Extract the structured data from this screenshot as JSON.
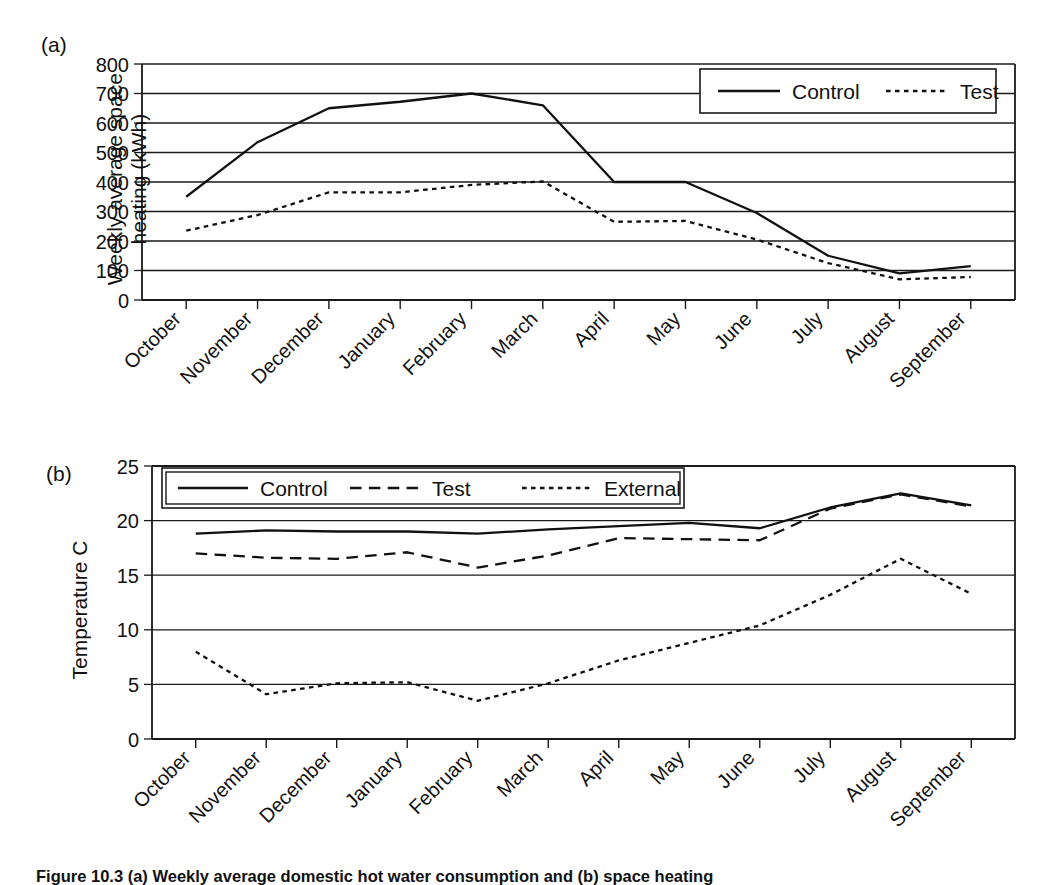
{
  "figure": {
    "panel_a_tag": "(a)",
    "panel_b_tag": "(b)",
    "caption": "Figure 10.3  (a) Weekly average domestic hot water consumption and (b) space heating"
  },
  "chart_data": [
    {
      "id": "panel-a",
      "type": "line",
      "title": "",
      "panel_label": "(a)",
      "xlabel": "",
      "ylabel": "Weekly average space\nheating (kWh)",
      "ylabel_flat": "Weekly average space heating (kWh)",
      "categories": [
        "October",
        "November",
        "December",
        "January",
        "February",
        "March",
        "April",
        "May",
        "June",
        "July",
        "August",
        "September"
      ],
      "ylim": [
        0,
        800
      ],
      "ytick_step": 100,
      "yticks": [
        "0",
        "100",
        "200",
        "300",
        "400",
        "500",
        "600",
        "700",
        "800"
      ],
      "grid": "horizontal",
      "legend_position": "top-right-inside",
      "series": [
        {
          "name": "Control",
          "style": "solid",
          "values": [
            350,
            535,
            650,
            672,
            700,
            660,
            400,
            400,
            295,
            150,
            90,
            115
          ]
        },
        {
          "name": "Test",
          "style": "dotted",
          "values": [
            235,
            288,
            365,
            365,
            390,
            402,
            265,
            268,
            205,
            125,
            70,
            78
          ]
        }
      ]
    },
    {
      "id": "panel-b",
      "type": "line",
      "title": "",
      "panel_label": "(b)",
      "xlabel": "",
      "ylabel": "Temperature C",
      "categories": [
        "October",
        "November",
        "December",
        "January",
        "February",
        "March",
        "April",
        "May",
        "June",
        "July",
        "August",
        "September"
      ],
      "ylim": [
        0,
        25
      ],
      "ytick_step": 5,
      "yticks": [
        "0",
        "5",
        "10",
        "15",
        "20",
        "25"
      ],
      "grid": "horizontal",
      "legend_position": "top-left-inside",
      "series": [
        {
          "name": "Control",
          "style": "solid",
          "values": [
            18.8,
            19.1,
            19.0,
            19.0,
            18.8,
            19.2,
            19.5,
            19.8,
            19.3,
            21.2,
            22.5,
            21.4
          ]
        },
        {
          "name": "Test",
          "style": "dashed",
          "values": [
            17.0,
            16.6,
            16.5,
            17.1,
            15.7,
            16.8,
            18.4,
            18.3,
            18.2,
            21.1,
            22.4,
            21.3
          ]
        },
        {
          "name": "External",
          "style": "dotted",
          "values": [
            8.0,
            4.1,
            5.1,
            5.2,
            3.5,
            5.1,
            7.2,
            8.8,
            10.4,
            13.2,
            16.5,
            13.3
          ]
        }
      ]
    }
  ],
  "panel_a": {
    "legend": [
      {
        "label": "Control",
        "style": "solid"
      },
      {
        "label": "Test",
        "style": "dotted"
      }
    ]
  },
  "panel_b": {
    "legend": [
      {
        "label": "Control",
        "style": "solid"
      },
      {
        "label": "Test",
        "style": "dashed"
      },
      {
        "label": "External",
        "style": "dotted"
      }
    ]
  }
}
